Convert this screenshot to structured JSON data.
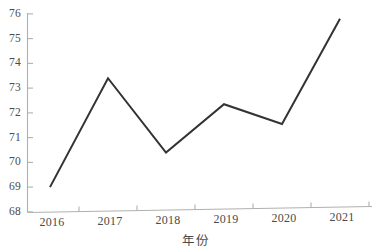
{
  "chart_data": {
    "type": "line",
    "title": "",
    "subtitle": "",
    "xlabel": "年份",
    "ylabel": "",
    "x": [
      2016,
      2017,
      2018,
      2019,
      2020,
      2021
    ],
    "categories": [
      "2016",
      "2017",
      "2018",
      "2019",
      "2020",
      "2021"
    ],
    "values": [
      69.0,
      73.4,
      70.4,
      72.35,
      71.55,
      75.8
    ],
    "series": [
      {
        "name": "",
        "values": [
          69.0,
          73.4,
          70.4,
          72.35,
          71.55,
          75.8
        ]
      }
    ],
    "xlim": [
      2015.6,
      2021.6
    ],
    "ylim": [
      68,
      76
    ],
    "ytick_labels": [
      "68",
      "69",
      "70",
      "71",
      "72",
      "73",
      "74",
      "75",
      "76"
    ],
    "ytick_values": [
      68,
      69,
      70,
      71,
      72,
      73,
      74,
      75,
      76
    ],
    "xtick_labels": [
      "2016",
      "2017",
      "2018",
      "2019",
      "2020",
      "2021"
    ],
    "grid": false,
    "legend": "none",
    "markers": "none",
    "annotations": [],
    "colors": {
      "line": "#333333",
      "axis": "#b0b0b0",
      "tick_text": "#4a4a4a",
      "background": "#ffffff"
    }
  }
}
